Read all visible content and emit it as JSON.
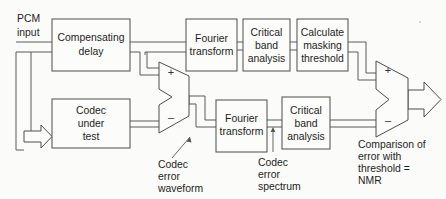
{
  "diagram": {
    "background_color": "#fbfbf9",
    "line_color": "#5a5a5a",
    "text_color": "#1d1d1d"
  },
  "io": {
    "input_label_line1": "PCM",
    "input_label_line2": "input"
  },
  "blocks": [
    {
      "id": "compensating-delay",
      "lines": [
        "Compensating",
        "delay"
      ],
      "x": 52,
      "y": 19,
      "w": 78,
      "h": 52
    },
    {
      "id": "codec-under-test",
      "lines": [
        "Codec",
        "under",
        "test"
      ],
      "x": 52,
      "y": 99,
      "w": 78,
      "h": 49
    },
    {
      "id": "fourier-transform-top",
      "lines": [
        "Fourier",
        "transform"
      ],
      "x": 186,
      "y": 19,
      "w": 51,
      "h": 52
    },
    {
      "id": "critical-band-analysis-top",
      "lines": [
        "Critical",
        "band",
        "analysis"
      ],
      "x": 243,
      "y": 19,
      "w": 47,
      "h": 52
    },
    {
      "id": "calculate-masking-threshold",
      "lines": [
        "Calculate",
        "masking",
        "threshold"
      ],
      "x": 297,
      "y": 19,
      "w": 51,
      "h": 52
    },
    {
      "id": "fourier-transform-bottom",
      "lines": [
        "Fourier",
        "transform"
      ],
      "x": 216,
      "y": 100,
      "w": 51,
      "h": 52
    },
    {
      "id": "critical-band-analysis-bottom",
      "lines": [
        "Critical",
        "band",
        "analysis"
      ],
      "x": 282,
      "y": 97,
      "w": 48,
      "h": 52
    }
  ],
  "summers": [
    {
      "id": "error-summer",
      "plus_sign": "+",
      "minus_sign": "–",
      "note": "subtracts codec output from delayed PCM reference"
    },
    {
      "id": "comparison-summer",
      "plus_sign": "+",
      "minus_sign": "–",
      "note": "compares masking threshold with error spectrum"
    }
  ],
  "annotations": [
    {
      "id": "codec-error-waveform",
      "lines": [
        "Codec",
        "error",
        "waveform"
      ]
    },
    {
      "id": "codec-error-spectrum",
      "lines": [
        "Codec",
        "error",
        "spectrum"
      ]
    },
    {
      "id": "comparison-nmr",
      "lines": [
        "Comparison of",
        "error with",
        "threshold =",
        "NMR"
      ]
    }
  ]
}
